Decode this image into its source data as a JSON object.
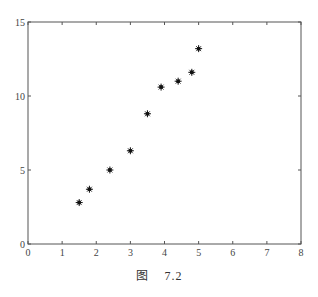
{
  "chart_data": {
    "type": "scatter",
    "title": "",
    "xlabel": "",
    "ylabel": "",
    "xlim": [
      0,
      8
    ],
    "ylim": [
      0,
      15
    ],
    "grid": false,
    "legend": null,
    "marker": "*",
    "x_ticks": [
      0,
      1,
      2,
      3,
      4,
      5,
      6,
      7,
      8
    ],
    "y_ticks": [
      0,
      5,
      10,
      15
    ],
    "series": [
      {
        "name": "data",
        "x": [
          1.5,
          1.8,
          2.4,
          3.0,
          3.5,
          3.9,
          4.4,
          4.8,
          5.0
        ],
        "y": [
          2.8,
          3.7,
          5.0,
          6.3,
          8.8,
          10.6,
          11.0,
          11.6,
          13.2
        ]
      }
    ]
  },
  "caption": {
    "prefix": "图",
    "number": "7.2"
  },
  "style": {
    "axis_color": "#555555",
    "marker_color": "#111111"
  }
}
